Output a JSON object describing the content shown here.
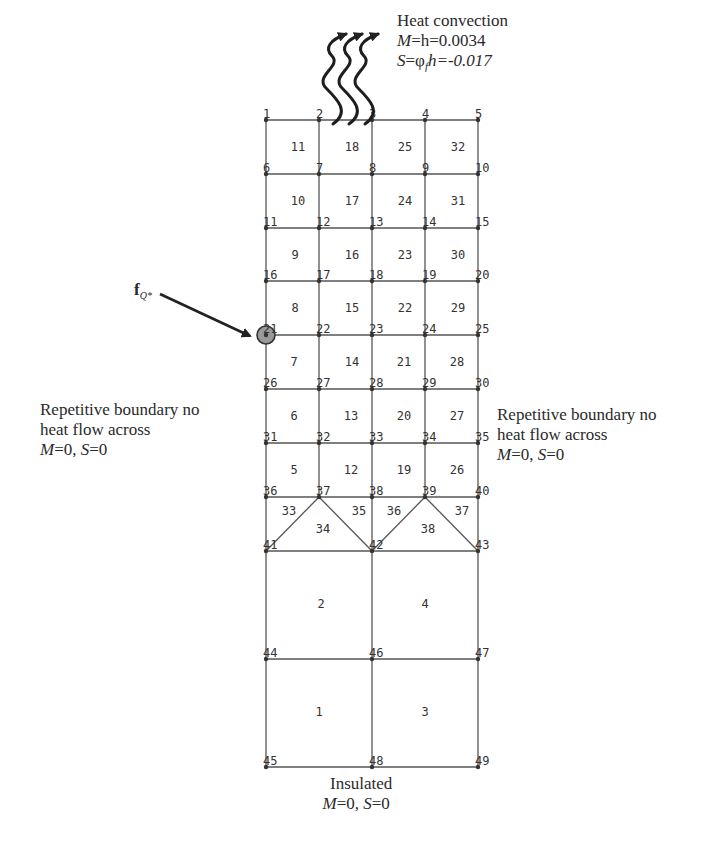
{
  "diagram": {
    "type": "finite-element-mesh",
    "grid": {
      "columns_x": [
        266,
        319,
        372,
        425,
        478
      ],
      "rows_y": [
        120,
        174,
        228,
        281,
        335,
        389,
        443,
        497,
        551,
        659,
        767
      ],
      "line_color": "#555555",
      "node_color": "#333333"
    },
    "nodes": [
      {
        "id": "1",
        "x": 266,
        "y": 120
      },
      {
        "id": "2",
        "x": 319,
        "y": 120
      },
      {
        "id": "3",
        "x": 372,
        "y": 120
      },
      {
        "id": "4",
        "x": 425,
        "y": 120
      },
      {
        "id": "5",
        "x": 478,
        "y": 120
      },
      {
        "id": "6",
        "x": 266,
        "y": 174
      },
      {
        "id": "7",
        "x": 319,
        "y": 174
      },
      {
        "id": "8",
        "x": 372,
        "y": 174
      },
      {
        "id": "9",
        "x": 425,
        "y": 174
      },
      {
        "id": "10",
        "x": 478,
        "y": 174
      },
      {
        "id": "11",
        "x": 266,
        "y": 228
      },
      {
        "id": "12",
        "x": 319,
        "y": 228
      },
      {
        "id": "13",
        "x": 372,
        "y": 228
      },
      {
        "id": "14",
        "x": 425,
        "y": 228
      },
      {
        "id": "15",
        "x": 478,
        "y": 228
      },
      {
        "id": "16",
        "x": 266,
        "y": 281
      },
      {
        "id": "17",
        "x": 319,
        "y": 281
      },
      {
        "id": "18",
        "x": 372,
        "y": 281
      },
      {
        "id": "19",
        "x": 425,
        "y": 281
      },
      {
        "id": "20",
        "x": 478,
        "y": 281
      },
      {
        "id": "21",
        "x": 266,
        "y": 335
      },
      {
        "id": "22",
        "x": 319,
        "y": 335
      },
      {
        "id": "23",
        "x": 372,
        "y": 335
      },
      {
        "id": "24",
        "x": 425,
        "y": 335
      },
      {
        "id": "25",
        "x": 478,
        "y": 335
      },
      {
        "id": "26",
        "x": 266,
        "y": 389
      },
      {
        "id": "27",
        "x": 319,
        "y": 389
      },
      {
        "id": "28",
        "x": 372,
        "y": 389
      },
      {
        "id": "29",
        "x": 425,
        "y": 389
      },
      {
        "id": "30",
        "x": 478,
        "y": 389
      },
      {
        "id": "31",
        "x": 266,
        "y": 443
      },
      {
        "id": "32",
        "x": 319,
        "y": 443
      },
      {
        "id": "33",
        "x": 372,
        "y": 443
      },
      {
        "id": "34",
        "x": 425,
        "y": 443
      },
      {
        "id": "35",
        "x": 478,
        "y": 443
      },
      {
        "id": "36",
        "x": 266,
        "y": 497
      },
      {
        "id": "37",
        "x": 319,
        "y": 497
      },
      {
        "id": "38",
        "x": 372,
        "y": 497
      },
      {
        "id": "39",
        "x": 425,
        "y": 497
      },
      {
        "id": "40",
        "x": 478,
        "y": 497
      },
      {
        "id": "41",
        "x": 266,
        "y": 551
      },
      {
        "id": "42",
        "x": 372,
        "y": 551
      },
      {
        "id": "43",
        "x": 478,
        "y": 551
      },
      {
        "id": "44",
        "x": 266,
        "y": 659
      },
      {
        "id": "46",
        "x": 372,
        "y": 659
      },
      {
        "id": "47",
        "x": 478,
        "y": 659
      },
      {
        "id": "45",
        "x": 266,
        "y": 767
      },
      {
        "id": "48",
        "x": 372,
        "y": 767
      },
      {
        "id": "49",
        "x": 478,
        "y": 767
      }
    ],
    "lines": [
      [
        266,
        120,
        478,
        120
      ],
      [
        266,
        174,
        478,
        174
      ],
      [
        266,
        228,
        478,
        228
      ],
      [
        266,
        281,
        478,
        281
      ],
      [
        266,
        335,
        478,
        335
      ],
      [
        266,
        389,
        478,
        389
      ],
      [
        266,
        443,
        478,
        443
      ],
      [
        266,
        497,
        478,
        497
      ],
      [
        266,
        551,
        478,
        551
      ],
      [
        266,
        659,
        478,
        659
      ],
      [
        266,
        767,
        478,
        767
      ],
      [
        266,
        120,
        266,
        767
      ],
      [
        319,
        120,
        319,
        497
      ],
      [
        372,
        120,
        372,
        767
      ],
      [
        425,
        120,
        425,
        497
      ],
      [
        478,
        120,
        478,
        767
      ],
      [
        319,
        497,
        266,
        551
      ],
      [
        319,
        497,
        372,
        551
      ],
      [
        425,
        497,
        372,
        551
      ],
      [
        425,
        497,
        478,
        551
      ]
    ],
    "elements": [
      {
        "id": "11",
        "x": 298,
        "y": 147
      },
      {
        "id": "18",
        "x": 352,
        "y": 147
      },
      {
        "id": "25",
        "x": 405,
        "y": 147
      },
      {
        "id": "32",
        "x": 458,
        "y": 147
      },
      {
        "id": "10",
        "x": 298,
        "y": 201
      },
      {
        "id": "17",
        "x": 352,
        "y": 201
      },
      {
        "id": "24",
        "x": 405,
        "y": 201
      },
      {
        "id": "31",
        "x": 458,
        "y": 201
      },
      {
        "id": "9",
        "x": 295,
        "y": 255
      },
      {
        "id": "16",
        "x": 352,
        "y": 255
      },
      {
        "id": "23",
        "x": 405,
        "y": 255
      },
      {
        "id": "30",
        "x": 458,
        "y": 255
      },
      {
        "id": "8",
        "x": 295,
        "y": 308
      },
      {
        "id": "15",
        "x": 352,
        "y": 308
      },
      {
        "id": "22",
        "x": 405,
        "y": 308
      },
      {
        "id": "29",
        "x": 458,
        "y": 308
      },
      {
        "id": "7",
        "x": 294,
        "y": 362
      },
      {
        "id": "14",
        "x": 352,
        "y": 362
      },
      {
        "id": "21",
        "x": 404,
        "y": 362
      },
      {
        "id": "28",
        "x": 457,
        "y": 362
      },
      {
        "id": "6",
        "x": 294,
        "y": 416
      },
      {
        "id": "13",
        "x": 351,
        "y": 416
      },
      {
        "id": "20",
        "x": 404,
        "y": 416
      },
      {
        "id": "27",
        "x": 457,
        "y": 416
      },
      {
        "id": "5",
        "x": 294,
        "y": 470
      },
      {
        "id": "12",
        "x": 351,
        "y": 470
      },
      {
        "id": "19",
        "x": 404,
        "y": 470
      },
      {
        "id": "26",
        "x": 457,
        "y": 470
      },
      {
        "id": "33",
        "x": 289,
        "y": 511
      },
      {
        "id": "34",
        "x": 323,
        "y": 529
      },
      {
        "id": "35",
        "x": 359,
        "y": 511
      },
      {
        "id": "36",
        "x": 394,
        "y": 511
      },
      {
        "id": "38",
        "x": 428,
        "y": 529
      },
      {
        "id": "37",
        "x": 462,
        "y": 511
      },
      {
        "id": "2",
        "x": 321,
        "y": 604
      },
      {
        "id": "4",
        "x": 425,
        "y": 604
      },
      {
        "id": "1",
        "x": 319,
        "y": 712
      },
      {
        "id": "3",
        "x": 425,
        "y": 712
      }
    ],
    "highlighted_node": {
      "id": "21",
      "cx": 266,
      "cy": 335,
      "r": 9,
      "fill": "#9a9a9a"
    }
  },
  "annotations": {
    "top": {
      "title": "Heat convection",
      "line1_var": "M",
      "line1_rest": "=h=0.0034",
      "line2_var": "S",
      "line2_rest": "=φ",
      "line2_sub": "f",
      "line2_tail": "h=-0.017"
    },
    "left_boundary": {
      "line1": "Repetitive boundary no",
      "line2": "heat flow across",
      "m_var": "M",
      "m_val": "=0, ",
      "s_var": "S",
      "s_val": "=0"
    },
    "right_boundary": {
      "line1": "Repetitive boundary no",
      "line2": "heat flow across",
      "m_var": "M",
      "m_val": "=0, ",
      "s_var": "S",
      "s_val": "=0"
    },
    "bottom": {
      "title": "Insulated",
      "m_var": "M",
      "m_val": "=0, ",
      "s_var": "S",
      "s_val": "=0"
    },
    "load": {
      "symbol": "f",
      "subscript": "Q*"
    }
  }
}
